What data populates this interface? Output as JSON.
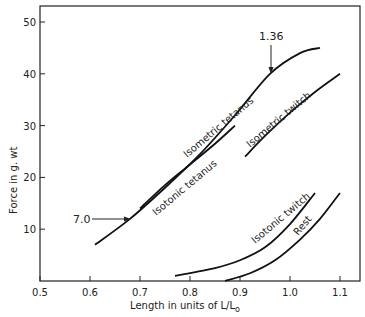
{
  "chart_data": {
    "type": "line",
    "title": "",
    "xlabel": "Length in units of L/L₀",
    "ylabel": "Force in g. wt",
    "xlim": [
      0.5,
      1.15
    ],
    "ylim": [
      0,
      52
    ],
    "x_ticks": [
      0.5,
      0.6,
      0.7,
      0.8,
      0.9,
      1.0,
      1.1
    ],
    "x_tick_labels": [
      "0.5",
      "0.6",
      "0.7",
      "0.8",
      "0.9",
      "1.0",
      "1.1"
    ],
    "y_ticks": [
      10,
      20,
      30,
      40,
      50
    ],
    "y_tick_labels": [
      "10",
      "20",
      "30",
      "40",
      "50"
    ],
    "grid": false,
    "legend": "none (curves labeled inline)",
    "series": [
      {
        "name": "Isometric tetanus",
        "x": [
          0.61,
          0.68,
          0.75,
          0.82,
          0.89,
          0.96,
          1.02,
          1.06
        ],
        "y": [
          7,
          12,
          18,
          24.5,
          32,
          40,
          44,
          45
        ]
      },
      {
        "name": "Isotonic tetanus",
        "x": [
          0.7,
          0.75,
          0.8,
          0.85,
          0.89
        ],
        "y": [
          14,
          18.5,
          22.5,
          26.5,
          30
        ]
      },
      {
        "name": "Isometric twitch",
        "x": [
          0.91,
          0.95,
          1.0,
          1.05,
          1.1
        ],
        "y": [
          24,
          28,
          32.5,
          36.5,
          40
        ]
      },
      {
        "name": "Isotonic twitch",
        "x": [
          0.77,
          0.85,
          0.9,
          0.95,
          1.0,
          1.05
        ],
        "y": [
          1,
          2.5,
          4,
          6.5,
          11,
          17
        ]
      },
      {
        "name": "Rest",
        "x": [
          0.87,
          0.92,
          0.97,
          1.02,
          1.06,
          1.1
        ],
        "y": [
          0,
          1.5,
          4,
          8,
          12,
          17
        ]
      }
    ],
    "annotations": [
      {
        "text": "7.0",
        "x": 0.68,
        "y": 12,
        "arrow": "horizontal, pointing right to isometric tetanus curve"
      },
      {
        "text": "1.36",
        "x": 0.96,
        "y": 40,
        "arrow": "vertical, pointing down to isometric tetanus curve"
      }
    ]
  },
  "labels": {
    "ylabel": "Force in g. wt",
    "xlabel_main": "Length in units of  L/L",
    "xlabel_sub": "o",
    "iso_tetanus": "Isometric tetanus",
    "isotonic_tetanus": "Isotonic tetanus",
    "iso_twitch": "Isometric twitch",
    "isotonic_twitch": "Isotonic twitch",
    "rest": "Rest",
    "ann1": "7.0",
    "ann2": "1.36"
  }
}
